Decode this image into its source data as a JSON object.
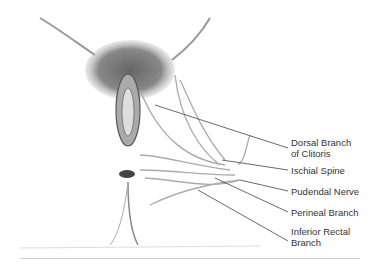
{
  "figure": {
    "labels": [
      {
        "id": "dorsal",
        "text": "Dorsal Branch\nof Clitoris"
      },
      {
        "id": "ischial",
        "text": "Ischial Spine"
      },
      {
        "id": "pudendal",
        "text": "Pudendal Nerve"
      },
      {
        "id": "perineal",
        "text": "Perineal Branch"
      },
      {
        "id": "inferior",
        "text": "Inferior Rectal\nBranch"
      }
    ]
  }
}
